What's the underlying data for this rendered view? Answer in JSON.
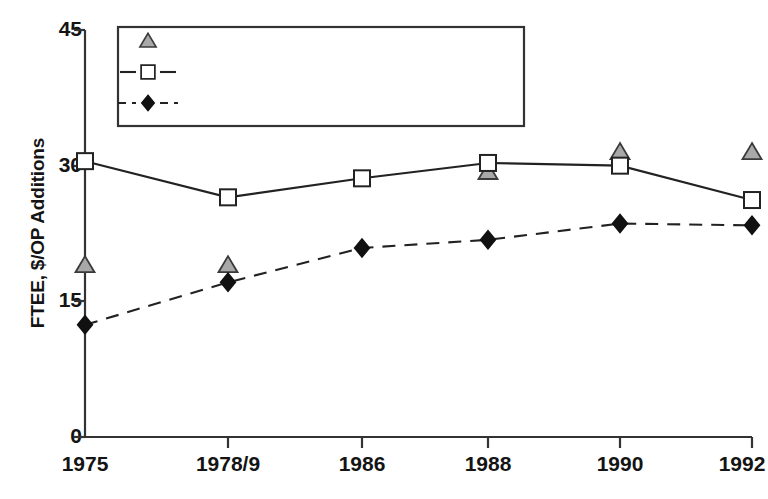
{
  "chart_data": {
    "type": "line",
    "title": "",
    "xlabel": "",
    "ylabel": "FTEE, $/OP Additions",
    "categories": [
      "1975",
      "1978/9",
      "1986",
      "1988",
      "1990",
      "1992"
    ],
    "ylim": [
      0,
      45
    ],
    "yticks": [
      0,
      15,
      30,
      45
    ],
    "grid": false,
    "legend_position": "top-left-inside",
    "series": [
      {
        "name": "Staff (FTEE/1,000 Adults)",
        "marker": "triangle",
        "marker_fill": "#a8a8a8",
        "line": "none",
        "values": [
          19.0,
          19.0,
          null,
          29.3,
          31.5,
          31.5
        ]
      },
      {
        "name": "Dollars/Adult (@1969 prices)",
        "marker": "square",
        "marker_fill": "#ffffff",
        "line": "solid",
        "values": [
          30.5,
          26.5,
          28.6,
          30.3,
          30.0,
          26.2
        ]
      },
      {
        "name": "OP Additions (Addition/1,000 Pop.)",
        "marker": "diamond",
        "marker_fill": "#111111",
        "line": "dashed",
        "values": [
          12.4,
          17.1,
          20.9,
          21.8,
          23.6,
          23.4
        ]
      }
    ]
  },
  "axes": {
    "y_title": "FTEE, $/OP Additions",
    "y_tick_labels": [
      "45",
      "30",
      "15",
      "0"
    ],
    "x_tick_labels": [
      "1975",
      "1978/9",
      "1986",
      "1988",
      "1990",
      "1992"
    ]
  },
  "legend": {
    "entries": [
      {
        "label": "Staff (FTEE/1,000 Adults)",
        "marker": "triangle-icon"
      },
      {
        "label": "Dollars/Adult (@1969 prices)",
        "marker": "square-icon"
      },
      {
        "label": "OP Additions (Addition/1,000 Pop.)",
        "marker": "diamond-icon"
      }
    ]
  },
  "colors": {
    "axis": "#333333",
    "line": "#222222",
    "staff_marker": "#a8a8a8",
    "dollars_marker": "#ffffff",
    "op_marker": "#111111",
    "background": "#ffffff"
  }
}
